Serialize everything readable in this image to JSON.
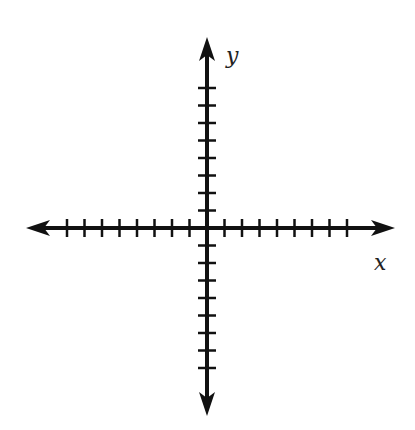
{
  "diagram": {
    "type": "coordinate-plane",
    "title": "",
    "colors": {
      "axis": "#111111",
      "label": "#222222",
      "background": "#ffffff"
    },
    "origin": {
      "x": 207,
      "y": 228
    },
    "tick_spacing": 17.5,
    "x_axis": {
      "label": "x",
      "ticks_negative": 8,
      "ticks_positive": 8,
      "arrow_left": 26,
      "arrow_right": 395
    },
    "y_axis": {
      "label": "y",
      "ticks_positive": 8,
      "ticks_negative": 8,
      "arrow_top": 37,
      "arrow_bottom": 416
    }
  }
}
